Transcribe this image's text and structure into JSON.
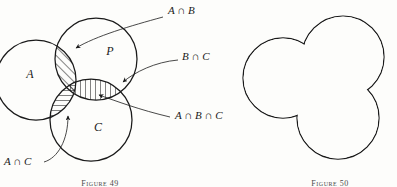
{
  "figure": {
    "domain": "set-theory-venn-diagram",
    "background_color": "#fdfdfb",
    "ink_color": "#1a1a1a",
    "left_figure": {
      "caption": "Figure 49",
      "set_labels": [
        {
          "name": "A",
          "text": "A",
          "x": 30,
          "y": 78
        },
        {
          "name": "B",
          "text": "P",
          "x": 110,
          "y": 55
        },
        {
          "name": "C",
          "text": "C",
          "x": 98,
          "y": 131
        }
      ],
      "circles": [
        {
          "name": "circle-a",
          "cx": 36,
          "cy": 80,
          "r": 40
        },
        {
          "name": "circle-b",
          "cx": 96,
          "cy": 59,
          "r": 41
        },
        {
          "name": "circle-c",
          "cx": 91,
          "cy": 120,
          "r": 41
        }
      ],
      "annotations": [
        {
          "name": "a-intersect-b",
          "text": "A ∩ B",
          "x": 168,
          "y": 14,
          "hatch": "diagonal"
        },
        {
          "name": "b-intersect-c",
          "text": "B ∩ C",
          "x": 182,
          "y": 60,
          "hatch": "vertical"
        },
        {
          "name": "a-intersect-b-intersect-c",
          "text": "A ∩ B ∩ C",
          "x": 175,
          "y": 119,
          "hatch": "none"
        },
        {
          "name": "a-intersect-c",
          "text": "A ∩ C",
          "x": 4,
          "y": 165,
          "hatch": "horizontal"
        }
      ]
    },
    "right_figure": {
      "caption": "Figure 50",
      "description": "union-outline",
      "circles": [
        {
          "name": "union-circle-a",
          "cx": 283,
          "cy": 78,
          "r": 40
        },
        {
          "name": "union-circle-b",
          "cx": 343,
          "cy": 57,
          "r": 41
        },
        {
          "name": "union-circle-c",
          "cx": 338,
          "cy": 118,
          "r": 41
        }
      ]
    }
  }
}
